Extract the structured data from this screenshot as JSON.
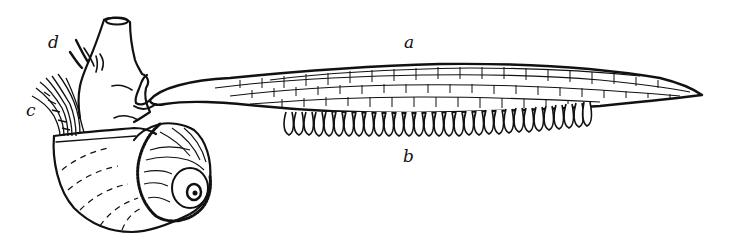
{
  "figure": {
    "ink_color": "#111111",
    "paper_color": "#ffffff",
    "labels": [
      {
        "id": "a",
        "text": "a",
        "target": "float-raft",
        "x": 408,
        "y": 33
      },
      {
        "id": "b",
        "text": "b",
        "target": "egg-capsules",
        "x": 405,
        "y": 150
      },
      {
        "id": "c",
        "text": "c",
        "target": "gill-tentacles",
        "x": 28,
        "y": 106
      },
      {
        "id": "d",
        "text": "d",
        "target": "head-tentacles",
        "x": 49,
        "y": 38
      }
    ]
  }
}
